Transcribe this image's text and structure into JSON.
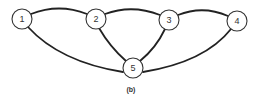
{
  "diagram": {
    "type": "graph",
    "caption": "(b)",
    "nodes": [
      {
        "id": "1",
        "label": "1",
        "x": 22,
        "y": 19
      },
      {
        "id": "2",
        "label": "2",
        "x": 96,
        "y": 19
      },
      {
        "id": "3",
        "label": "3",
        "x": 169,
        "y": 20
      },
      {
        "id": "4",
        "label": "4",
        "x": 237,
        "y": 21
      },
      {
        "id": "5",
        "label": "5",
        "x": 133,
        "y": 68
      }
    ],
    "edges": [
      {
        "from": "1",
        "to": "2"
      },
      {
        "from": "2",
        "to": "3"
      },
      {
        "from": "3",
        "to": "4"
      },
      {
        "from": "1",
        "to": "5"
      },
      {
        "from": "2",
        "to": "5"
      },
      {
        "from": "3",
        "to": "5"
      },
      {
        "from": "4",
        "to": "5"
      }
    ],
    "colors": {
      "stroke": "#222222",
      "node_fill": "#ffffff",
      "background": "#ffffff"
    }
  }
}
